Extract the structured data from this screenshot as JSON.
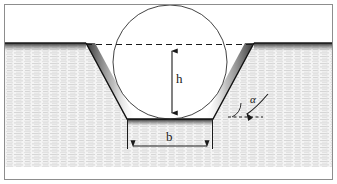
{
  "figure": {
    "background_color": "#ffffff",
    "frame_color": "#8d8d8d",
    "line_color": "#1a1a1a",
    "ground_fill_color": "#f2f2f2",
    "ground_hatch_color": "#c8c8c8",
    "shadow_color": "#2a2a2a",
    "trench_fill_color": "#ffffff"
  },
  "labels": {
    "height": "h",
    "bottom_width": "b",
    "slope_angle": "α"
  },
  "annotations": {
    "height_dimension_name": "h",
    "bottom_width_dimension_name": "b",
    "slope_angle_name": "alpha"
  },
  "geometry": {
    "ground_surface_y": 43,
    "trench_bottom_y": 119,
    "trench_bottom_left_x": 127,
    "trench_bottom_right_x": 213,
    "trench_top_left_x": 86,
    "trench_top_right_x": 254,
    "circle_center_x": 170,
    "circle_center_y": 62,
    "circle_radius": 57,
    "dashed_surface_line_y": 45,
    "h_arrow_x": 172,
    "h_arrow_top_y": 46,
    "h_arrow_bottom_y": 119,
    "b_arrow_y": 146,
    "b_arrow_left_x": 127,
    "b_arrow_right_x": 213,
    "alpha_dash_y": 117,
    "alpha_dash_x1": 228,
    "alpha_dash_x2": 263
  }
}
